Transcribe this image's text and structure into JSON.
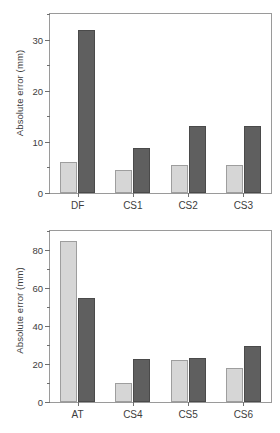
{
  "chart_data": [
    {
      "id": "top",
      "type": "bar",
      "title": "",
      "xlabel": "",
      "ylabel": "Absolute error (mm)",
      "ylim": [
        0,
        35
      ],
      "yticks": [
        0,
        10,
        20,
        30
      ],
      "ytick_labels": [
        "0",
        "10",
        "20",
        "30"
      ],
      "yminor_step": 5,
      "grid": false,
      "legend": "none",
      "categories": [
        "DF",
        "CS1",
        "CS2",
        "CS3"
      ],
      "series": [
        {
          "name": "light",
          "color": "#d6d6d6",
          "values": [
            6.0,
            4.5,
            5.5,
            5.5
          ]
        },
        {
          "name": "dark",
          "color": "#5f5f5f",
          "values": [
            31.8,
            8.8,
            13.2,
            13.1
          ]
        }
      ]
    },
    {
      "id": "bottom",
      "type": "bar",
      "title": "",
      "xlabel": "",
      "ylabel": "Absolute error (mm)",
      "ylim": [
        0,
        90
      ],
      "yticks": [
        0,
        20,
        40,
        60,
        80
      ],
      "ytick_labels": [
        "0",
        "20",
        "40",
        "60",
        "80"
      ],
      "yminor_step": 10,
      "grid": false,
      "legend": "none",
      "categories": [
        "AT",
        "CS4",
        "CS5",
        "CS6"
      ],
      "series": [
        {
          "name": "light",
          "color": "#d6d6d6",
          "values": [
            85.0,
            10.0,
            22.0,
            18.0
          ]
        },
        {
          "name": "dark",
          "color": "#5f5f5f",
          "values": [
            54.5,
            22.5,
            23.0,
            29.5
          ]
        }
      ]
    }
  ],
  "panels": {
    "top": {
      "axis_title": "Absolute error (mm)"
    },
    "bottom": {
      "axis_title": "Absolute error (mm)"
    }
  }
}
